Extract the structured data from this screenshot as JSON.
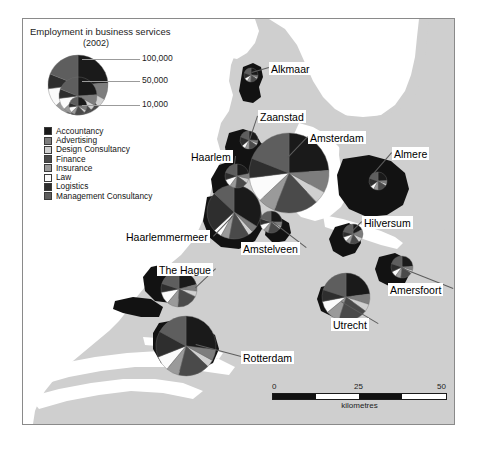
{
  "legend": {
    "title": "Employment in business services",
    "subtitle": "(2002)",
    "scale_ticks": [
      "100,000",
      "50,000",
      "10,000"
    ],
    "keys": [
      {
        "label": "Accountancy",
        "color": "#1a1a1a"
      },
      {
        "label": "Advertising",
        "color": "#7d7d7d"
      },
      {
        "label": "Design Consultancy",
        "color": "#d0d0d0"
      },
      {
        "label": "Finance",
        "color": "#4a4a4a"
      },
      {
        "label": "Insurance",
        "color": "#9a9a9a"
      },
      {
        "label": "Law",
        "color": "#fbfbfb"
      },
      {
        "label": "Logistics",
        "color": "#2e2e2e"
      },
      {
        "label": "Management Consultancy",
        "color": "#5e5e5e"
      }
    ]
  },
  "scalebar": {
    "caption": "kilometres",
    "ticks": [
      "0",
      "25",
      "50"
    ]
  },
  "colors": {
    "land": "#cfcfcf",
    "water": "#ffffff",
    "city": "#121212",
    "frame": "#8a8a8a",
    "leader": "#5d5d5d"
  },
  "places": [
    {
      "name": "Alkmaar",
      "label_x": 269,
      "label_y": 62,
      "anchor_x": 252,
      "anchor_y": 73
    },
    {
      "name": "Zaanstad",
      "label_x": 258,
      "label_y": 110,
      "anchor_x": 250,
      "anchor_y": 140
    },
    {
      "name": "Amsterdam",
      "label_x": 308,
      "label_y": 131,
      "anchor_x": 288,
      "anchor_y": 158
    },
    {
      "name": "Almere",
      "label_x": 392,
      "label_y": 147,
      "anchor_x": 372,
      "anchor_y": 176
    },
    {
      "name": "Haarlem",
      "label_x": 189,
      "label_y": 150,
      "anchor_x": 234,
      "anchor_y": 172
    },
    {
      "name": "Hilversum",
      "label_x": 362,
      "label_y": 216,
      "anchor_x": 352,
      "anchor_y": 232
    },
    {
      "name": "Haarlemmermeer",
      "label_x": 124,
      "label_y": 230,
      "anchor_x": 232,
      "anchor_y": 216
    },
    {
      "name": "Amstelveen",
      "label_x": 241,
      "label_y": 242,
      "anchor_x": 272,
      "anchor_y": 222
    },
    {
      "name": "Amersfoort",
      "label_x": 388,
      "label_y": 283,
      "anchor_x": 400,
      "anchor_y": 268
    },
    {
      "name": "The Hague",
      "label_x": 157,
      "label_y": 263,
      "anchor_x": 196,
      "anchor_y": 288
    },
    {
      "name": "Utrecht",
      "label_x": 331,
      "label_y": 318,
      "anchor_x": 341,
      "anchor_y": 302
    },
    {
      "name": "Rotterdam",
      "label_x": 241,
      "label_y": 351,
      "anchor_x": 196,
      "anchor_y": 345
    }
  ],
  "chart_data": {
    "type": "pie",
    "title": "Employment in business services (2002)",
    "subtitle": "Proportional pie charts, Randstad region, Netherlands",
    "categories": [
      "Accountancy",
      "Advertising",
      "Design Consultancy",
      "Finance",
      "Insurance",
      "Law",
      "Logistics",
      "Management Consultancy"
    ],
    "category_colors": [
      "#1a1a1a",
      "#7d7d7d",
      "#d0d0d0",
      "#4a4a4a",
      "#9a9a9a",
      "#fbfbfb",
      "#2e2e2e",
      "#5e5e5e"
    ],
    "size_legend": {
      "values": [
        100000,
        50000,
        10000
      ],
      "unit": "employees"
    },
    "legend_position": "top-left",
    "pies": [
      {
        "name": "Amsterdam",
        "cx": 288,
        "cy": 172,
        "r": 40,
        "total": 100000,
        "values": [
          24,
          9,
          5,
          18,
          7,
          10,
          8,
          19
        ]
      },
      {
        "name": "Rotterdam",
        "cx": 185,
        "cy": 345,
        "r": 30,
        "total": 58000,
        "values": [
          27,
          6,
          4,
          17,
          7,
          8,
          14,
          17
        ]
      },
      {
        "name": "Haarlemmermeer",
        "cx": 233,
        "cy": 211,
        "r": 27,
        "total": 46000,
        "values": [
          34,
          4,
          3,
          12,
          5,
          5,
          24,
          13
        ]
      },
      {
        "name": "Utrecht",
        "cx": 345,
        "cy": 296,
        "r": 24,
        "total": 38000,
        "values": [
          23,
          7,
          5,
          20,
          9,
          8,
          8,
          20
        ]
      },
      {
        "name": "The Hague",
        "cx": 178,
        "cy": 288,
        "r": 18,
        "total": 23000,
        "values": [
          21,
          6,
          5,
          19,
          10,
          11,
          8,
          20
        ]
      },
      {
        "name": "Haarlem",
        "cx": 236,
        "cy": 175,
        "r": 12,
        "total": 11000,
        "values": [
          22,
          7,
          6,
          17,
          8,
          10,
          10,
          20
        ]
      },
      {
        "name": "Zaanstad",
        "cx": 248,
        "cy": 139,
        "r": 9,
        "total": 7000,
        "values": [
          26,
          5,
          4,
          15,
          7,
          7,
          17,
          19
        ]
      },
      {
        "name": "Amstelveen",
        "cx": 270,
        "cy": 221,
        "r": 11,
        "total": 9500,
        "values": [
          25,
          6,
          5,
          18,
          8,
          9,
          9,
          20
        ]
      },
      {
        "name": "Almere",
        "cx": 377,
        "cy": 180,
        "r": 9,
        "total": 7000,
        "values": [
          24,
          6,
          4,
          16,
          8,
          7,
          15,
          20
        ]
      },
      {
        "name": "Hilversum",
        "cx": 352,
        "cy": 233,
        "r": 10,
        "total": 8000,
        "values": [
          18,
          14,
          8,
          15,
          7,
          8,
          9,
          21
        ]
      },
      {
        "name": "Amersfoort",
        "cx": 401,
        "cy": 266,
        "r": 11,
        "total": 9500,
        "values": [
          24,
          6,
          5,
          17,
          8,
          8,
          12,
          20
        ]
      },
      {
        "name": "Alkmaar",
        "cx": 250,
        "cy": 74,
        "r": 7,
        "total": 4500,
        "values": [
          26,
          5,
          4,
          16,
          8,
          8,
          13,
          20
        ]
      }
    ]
  }
}
